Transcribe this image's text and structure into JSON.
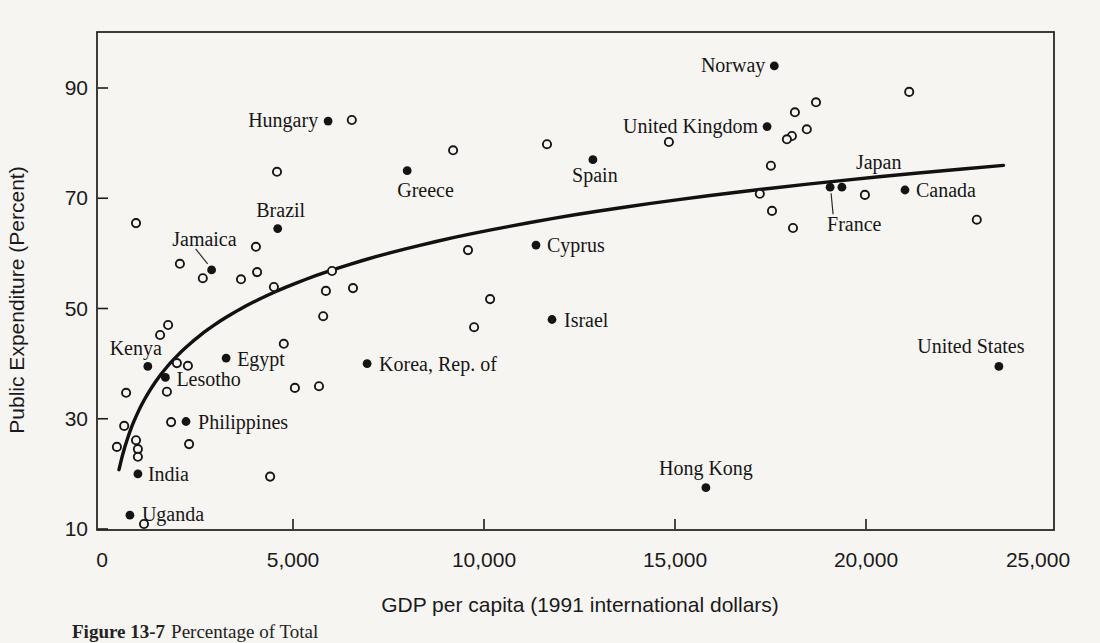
{
  "figure": {
    "caption_label": "Figure 13-7",
    "caption_text": "Percentage of Total"
  },
  "chart_data": {
    "type": "scatter",
    "title": "",
    "xlabel": "GDP per capita (1991 international dollars)",
    "ylabel": "Public Expenditure (Percent)",
    "xlim": [
      0,
      25000
    ],
    "ylim": [
      10,
      100
    ],
    "grid": false,
    "legend": "none",
    "x_tick_values": [
      0,
      5000,
      10000,
      15000,
      20000,
      25000
    ],
    "x_tick_labels": [
      "0",
      "5,000",
      "10,000",
      "15,000",
      "20,000",
      "25,000"
    ],
    "y_tick_values": [
      10,
      30,
      50,
      70,
      90
    ],
    "y_tick_labels": [
      "10",
      "30",
      "50",
      "70",
      "90"
    ],
    "trend_curve": {
      "type": "log",
      "formula": "pct = -64 + 13.9*ln(gdp)",
      "a": -64,
      "b": 13.9,
      "domain": [
        445,
        23600
      ]
    },
    "labeled_points": [
      {
        "name": "Uganda",
        "gdp": 730,
        "pct": 12.5,
        "anchor": "start",
        "dx": 12,
        "dy": 6
      },
      {
        "name": "India",
        "gdp": 940,
        "pct": 20,
        "anchor": "start",
        "dx": 10,
        "dy": 7
      },
      {
        "name": "Kenya",
        "gdp": 1200,
        "pct": 39.5,
        "anchor": "end",
        "dx": 14,
        "dy": -11
      },
      {
        "name": "Lesotho",
        "gdp": 1660,
        "pct": 37.5,
        "anchor": "start",
        "dx": 11,
        "dy": 9
      },
      {
        "name": "Philippines",
        "gdp": 2200,
        "pct": 29.5,
        "anchor": "start",
        "dx": 12,
        "dy": 7
      },
      {
        "name": "Jamaica",
        "gdp": 2870,
        "pct": 57,
        "anchor": "end",
        "dx": 25,
        "dy": -24,
        "leader": [
          -16,
          -21,
          -4,
          -6
        ]
      },
      {
        "name": "Egypt",
        "gdp": 3250,
        "pct": 41,
        "anchor": "start",
        "dx": 11,
        "dy": 8
      },
      {
        "name": "Brazil",
        "gdp": 4600,
        "pct": 64.5,
        "anchor": "middle",
        "dx": 3,
        "dy": -12
      },
      {
        "name": "Hungary",
        "gdp": 5920,
        "pct": 84,
        "anchor": "end",
        "dx": -10,
        "dy": 6
      },
      {
        "name": "Korea, Rep. of",
        "gdp": 6940,
        "pct": 40,
        "anchor": "start",
        "dx": 12,
        "dy": 7
      },
      {
        "name": "Greece",
        "gdp": 7990,
        "pct": 75,
        "anchor": "start",
        "dx": -10,
        "dy": 26
      },
      {
        "name": "Cyprus",
        "gdp": 11360,
        "pct": 61.5,
        "anchor": "start",
        "dx": 11,
        "dy": 7
      },
      {
        "name": "Israel",
        "gdp": 11780,
        "pct": 48,
        "anchor": "start",
        "dx": 12,
        "dy": 7
      },
      {
        "name": "Spain",
        "gdp": 12850,
        "pct": 77,
        "anchor": "middle",
        "dx": 2,
        "dy": 22
      },
      {
        "name": "Hong Kong",
        "gdp": 15810,
        "pct": 17.5,
        "anchor": "middle",
        "dx": 0,
        "dy": -13
      },
      {
        "name": "Norway",
        "gdp": 17600,
        "pct": 94,
        "anchor": "end",
        "dx": -9,
        "dy": 6
      },
      {
        "name": "United Kingdom",
        "gdp": 17410,
        "pct": 83,
        "anchor": "end",
        "dx": -9,
        "dy": 6
      },
      {
        "name": "France",
        "gdp": 19060,
        "pct": 72,
        "anchor": "start",
        "dx": -3,
        "dy": 44,
        "leader": [
          3,
          27,
          1,
          6
        ]
      },
      {
        "name": "Japan",
        "gdp": 19370,
        "pct": 72,
        "anchor": "start",
        "dx": 14,
        "dy": -18
      },
      {
        "name": "Canada",
        "gdp": 21020,
        "pct": 71.5,
        "anchor": "start",
        "dx": 11,
        "dy": 7
      },
      {
        "name": "United States",
        "gdp": 23480,
        "pct": 39.5,
        "anchor": "middle",
        "dx": -28,
        "dy": -13
      }
    ],
    "unlabeled_points": [
      [
        890,
        65.5
      ],
      [
        4580,
        74.8
      ],
      [
        6540,
        84.2
      ],
      [
        9190,
        78.7
      ],
      [
        11650,
        79.8
      ],
      [
        14840,
        80.2
      ],
      [
        18690,
        87.4
      ],
      [
        18140,
        85.6
      ],
      [
        18450,
        82.5
      ],
      [
        18060,
        81.3
      ],
      [
        17930,
        80.7
      ],
      [
        21130,
        89.3
      ],
      [
        17510,
        75.9
      ],
      [
        17220,
        70.8
      ],
      [
        17540,
        67.7
      ],
      [
        18090,
        64.6
      ],
      [
        19970,
        70.6
      ],
      [
        22900,
        66.1
      ],
      [
        9580,
        60.6
      ],
      [
        10160,
        51.7
      ],
      [
        9740,
        46.6
      ],
      [
        2040,
        58.1
      ],
      [
        2640,
        55.5
      ],
      [
        4030,
        61.2
      ],
      [
        4060,
        56.6
      ],
      [
        3640,
        55.3
      ],
      [
        4500,
        53.9
      ],
      [
        6020,
        56.8
      ],
      [
        5860,
        53.2
      ],
      [
        6570,
        53.7
      ],
      [
        5790,
        48.6
      ],
      [
        4760,
        43.6
      ],
      [
        5050,
        35.6
      ],
      [
        5680,
        35.9
      ],
      [
        1730,
        47.0
      ],
      [
        1520,
        45.2
      ],
      [
        1960,
        40.1
      ],
      [
        2250,
        39.6
      ],
      [
        1700,
        34.9
      ],
      [
        630,
        34.7
      ],
      [
        580,
        28.7
      ],
      [
        890,
        26.1
      ],
      [
        390,
        24.9
      ],
      [
        940,
        24.5
      ],
      [
        940,
        23.1
      ],
      [
        2280,
        25.4
      ],
      [
        1810,
        29.4
      ],
      [
        4400,
        19.5
      ],
      [
        1100,
        10.9
      ]
    ]
  }
}
